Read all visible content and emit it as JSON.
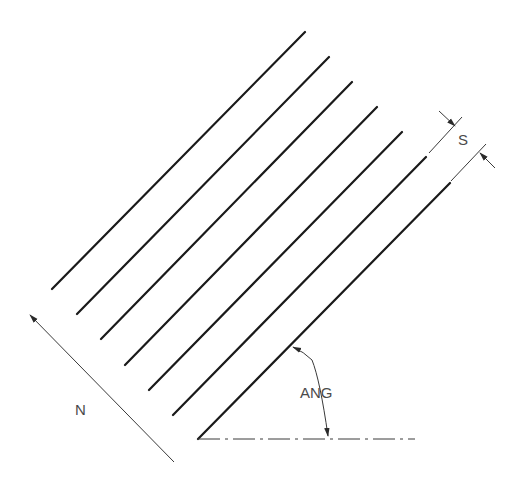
{
  "diagram": {
    "labels": {
      "spacing": "S",
      "angle": "ANG",
      "normal": "N"
    },
    "hatch_lines": [
      {
        "x1": 52,
        "y1": 289,
        "x2": 305,
        "y2": 32
      },
      {
        "x1": 77,
        "y1": 314,
        "x2": 329,
        "y2": 57
      },
      {
        "x1": 101,
        "y1": 339,
        "x2": 352,
        "y2": 82
      },
      {
        "x1": 125,
        "y1": 365,
        "x2": 377,
        "y2": 107
      },
      {
        "x1": 149,
        "y1": 390,
        "x2": 402,
        "y2": 132
      },
      {
        "x1": 173,
        "y1": 415,
        "x2": 426,
        "y2": 157
      },
      {
        "x1": 198,
        "y1": 439,
        "x2": 450,
        "y2": 183
      }
    ],
    "colors": {
      "line": "#1a1a1a",
      "annotation": "#3a3a3a",
      "text": "#4a4a4a",
      "background": "#ffffff"
    }
  }
}
